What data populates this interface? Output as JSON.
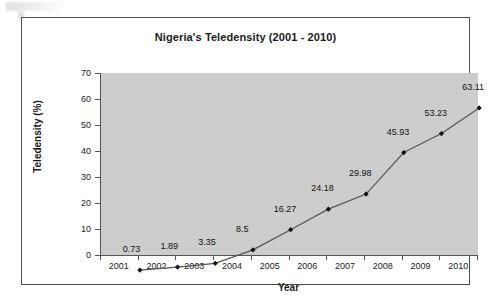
{
  "chart_data": {
    "type": "line",
    "title": "Nigeria's Teledensity (2001 - 2010)",
    "xlabel": "Year",
    "ylabel": "Teledensity (%)",
    "categories": [
      "2001",
      "2002",
      "2003",
      "2004",
      "2005",
      "2006",
      "2007",
      "2008",
      "2009",
      "2010"
    ],
    "values": [
      0.73,
      1.89,
      3.35,
      8.5,
      16.27,
      24.18,
      29.98,
      45.93,
      53.23,
      63.11
    ],
    "point_labels": [
      "0.73",
      "1.89",
      "3.35",
      "8.5",
      "16.27",
      "24.18",
      "29.98",
      "45.93",
      "53.23",
      "63.11"
    ],
    "ylim": [
      0,
      70
    ],
    "ytick_labels": [
      "0",
      "10",
      "20",
      "30",
      "40",
      "50",
      "60",
      "70"
    ],
    "ytick_values": [
      0,
      10,
      20,
      30,
      40,
      50,
      60,
      70
    ],
    "grid": false,
    "legend": "none",
    "marker": "diamond",
    "series_name": "Teledensity",
    "colors": {
      "plot_background": "#cfcfcf",
      "figure_background": "#ffffff",
      "line": "#555555",
      "marker": "#111111",
      "axis": "#555555",
      "text": "#1a1a1a",
      "frame": "#4d4d4d"
    }
  }
}
